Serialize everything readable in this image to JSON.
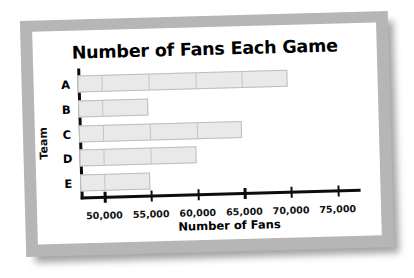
{
  "figure": {
    "frame_color": "#b6b6b6",
    "panel_color": "#ffffff"
  },
  "chart_data": {
    "type": "bar",
    "orientation": "horizontal",
    "title": "Number of Fans Each Game",
    "xlabel": "Number of Fans",
    "ylabel": "Team",
    "categories": [
      "A",
      "B",
      "C",
      "D",
      "E"
    ],
    "values": [
      70000,
      55000,
      65000,
      60000,
      55000
    ],
    "xtick_labels": [
      "50,000",
      "55,000",
      "60,000",
      "65,000",
      "70,000",
      "75,000"
    ],
    "xtick_values": [
      50000,
      55000,
      60000,
      65000,
      70000,
      75000
    ],
    "xlim": [
      47500,
      77500
    ],
    "grid": false,
    "legend": null,
    "bar_color": "#e9e9e9",
    "bar_edge_color": "#bdbdbd",
    "axis_color": "#0d0d0d"
  }
}
